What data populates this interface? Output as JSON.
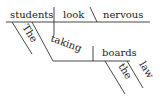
{
  "diagram": {
    "type": "sentence-diagram",
    "sentence_words": {
      "subject": "students",
      "verb": "look",
      "predicate_adjective": "nervous",
      "subject_modifier": "The",
      "participle": "taking",
      "object": "boards",
      "object_article": "the",
      "object_modifier": "law"
    },
    "colors": {
      "line": "#333333",
      "text": "#222222",
      "background": "#ffffff"
    }
  }
}
